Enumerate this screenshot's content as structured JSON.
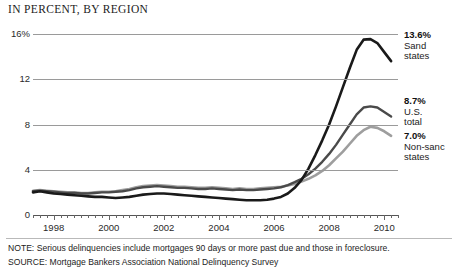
{
  "chart_data": {
    "type": "line",
    "title": "IN PERCENT, BY REGION",
    "xlabel": "",
    "ylabel": "",
    "xlim": [
      1997.25,
      2010.5
    ],
    "ylim": [
      0,
      16
    ],
    "grid": true,
    "legend_position": "right-inline-labels",
    "y_ticks": [
      "16%",
      "12",
      "8",
      "4",
      "0"
    ],
    "y_tick_values": [
      16,
      12,
      8,
      4,
      0
    ],
    "x_ticks": [
      "1998",
      "2000",
      "2002",
      "2004",
      "2006",
      "2008",
      "2010"
    ],
    "x_tick_values": [
      1998,
      2000,
      2002,
      2004,
      2006,
      2008,
      2010
    ],
    "x_minor_tick_interval_years": 0.25,
    "series": [
      {
        "name": "Sand states",
        "end_value": 13.6,
        "end_label": "13.6%",
        "color": "#1a1a1a",
        "width": 2.6,
        "x": [
          1997.25,
          1997.5,
          1997.75,
          1998,
          1998.25,
          1998.5,
          1998.75,
          1999,
          1999.25,
          1999.5,
          1999.75,
          2000,
          2000.25,
          2000.5,
          2000.75,
          2001,
          2001.25,
          2001.5,
          2001.75,
          2002,
          2002.25,
          2002.5,
          2002.75,
          2003,
          2003.25,
          2003.5,
          2003.75,
          2004,
          2004.25,
          2004.5,
          2004.75,
          2005,
          2005.25,
          2005.5,
          2005.75,
          2006,
          2006.25,
          2006.5,
          2006.75,
          2007,
          2007.25,
          2007.5,
          2007.75,
          2008,
          2008.25,
          2008.5,
          2008.75,
          2009,
          2009.25,
          2009.5,
          2009.75,
          2010,
          2010.25
        ],
        "y": [
          2.0,
          2.1,
          2.0,
          1.9,
          1.85,
          1.8,
          1.75,
          1.7,
          1.65,
          1.6,
          1.6,
          1.55,
          1.5,
          1.55,
          1.6,
          1.7,
          1.8,
          1.85,
          1.9,
          1.9,
          1.85,
          1.8,
          1.75,
          1.7,
          1.65,
          1.6,
          1.55,
          1.5,
          1.45,
          1.4,
          1.35,
          1.3,
          1.3,
          1.3,
          1.35,
          1.45,
          1.6,
          1.9,
          2.4,
          3.1,
          4.1,
          5.3,
          6.6,
          8.0,
          9.6,
          11.3,
          13.0,
          14.6,
          15.5,
          15.55,
          15.2,
          14.4,
          13.6
        ]
      },
      {
        "name": "U.S. total",
        "end_value": 8.7,
        "end_label": "8.7%",
        "color": "#4a4a4a",
        "width": 2.4,
        "x": [
          1997.25,
          1997.5,
          1997.75,
          1998,
          1998.25,
          1998.5,
          1998.75,
          1999,
          1999.25,
          1999.5,
          1999.75,
          2000,
          2000.25,
          2000.5,
          2000.75,
          2001,
          2001.25,
          2001.5,
          2001.75,
          2002,
          2002.25,
          2002.5,
          2002.75,
          2003,
          2003.25,
          2003.5,
          2003.75,
          2004,
          2004.25,
          2004.5,
          2004.75,
          2005,
          2005.25,
          2005.5,
          2005.75,
          2006,
          2006.25,
          2006.5,
          2006.75,
          2007,
          2007.25,
          2007.5,
          2007.75,
          2008,
          2008.25,
          2008.5,
          2008.75,
          2009,
          2009.25,
          2009.5,
          2009.75,
          2010,
          2010.25
        ],
        "y": [
          2.1,
          2.15,
          2.1,
          2.05,
          2.0,
          1.95,
          1.95,
          1.9,
          1.9,
          1.95,
          2.0,
          2.0,
          2.05,
          2.1,
          2.2,
          2.35,
          2.45,
          2.5,
          2.55,
          2.5,
          2.45,
          2.4,
          2.4,
          2.35,
          2.3,
          2.3,
          2.35,
          2.3,
          2.25,
          2.2,
          2.25,
          2.2,
          2.2,
          2.25,
          2.3,
          2.35,
          2.45,
          2.65,
          2.9,
          3.2,
          3.6,
          4.1,
          4.7,
          5.4,
          6.2,
          7.1,
          8.0,
          8.9,
          9.5,
          9.6,
          9.5,
          9.1,
          8.7
        ]
      },
      {
        "name": "Non-sand states",
        "end_value": 7.0,
        "end_label": "7.0%",
        "color": "#9e9e9e",
        "width": 2.6,
        "x": [
          1997.25,
          1997.5,
          1997.75,
          1998,
          1998.25,
          1998.5,
          1998.75,
          1999,
          1999.25,
          1999.5,
          1999.75,
          2000,
          2000.25,
          2000.5,
          2000.75,
          2001,
          2001.25,
          2001.5,
          2001.75,
          2002,
          2002.25,
          2002.5,
          2002.75,
          2003,
          2003.25,
          2003.5,
          2003.75,
          2004,
          2004.25,
          2004.5,
          2004.75,
          2005,
          2005.25,
          2005.5,
          2005.75,
          2006,
          2006.25,
          2006.5,
          2006.75,
          2007,
          2007.25,
          2007.5,
          2007.75,
          2008,
          2008.25,
          2008.5,
          2008.75,
          2009,
          2009.25,
          2009.5,
          2009.75,
          2010,
          2010.25
        ],
        "y": [
          2.15,
          2.2,
          2.15,
          2.1,
          2.05,
          2.0,
          2.0,
          1.95,
          1.95,
          2.0,
          2.05,
          2.05,
          2.1,
          2.2,
          2.3,
          2.45,
          2.55,
          2.6,
          2.65,
          2.6,
          2.55,
          2.5,
          2.5,
          2.45,
          2.4,
          2.4,
          2.45,
          2.4,
          2.35,
          2.3,
          2.35,
          2.3,
          2.3,
          2.35,
          2.4,
          2.45,
          2.5,
          2.6,
          2.75,
          2.95,
          3.2,
          3.5,
          3.9,
          4.4,
          5.0,
          5.6,
          6.3,
          7.0,
          7.5,
          7.8,
          7.7,
          7.4,
          7.0
        ]
      }
    ]
  },
  "callouts": [
    {
      "value": "13.6%",
      "name_line1": "Sand",
      "name_line2": "states"
    },
    {
      "value": "8.7%",
      "name_line1": "U.S.",
      "name_line2": "total"
    },
    {
      "value": "7.0%",
      "name_line1": "Non-sanc",
      "name_line2": "states"
    }
  ],
  "footnotes": {
    "note": "NOTE: Serious delinquencies include mortgages 90 days or more past due and those in foreclosure.",
    "source": "SOURCE: Mortgage Bankers Association National Delinquency Survey"
  }
}
